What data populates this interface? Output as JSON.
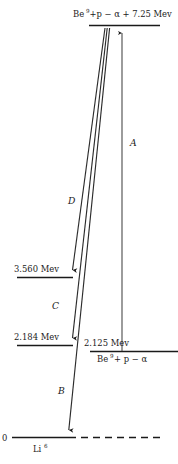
{
  "diagram": {
    "energy_unit": "Mev",
    "colors": {
      "line": "#1a1a1a",
      "transition": "#2b2b2b",
      "transition_a": "#4a4a4a",
      "background": "#ffffff"
    },
    "levels": [
      {
        "id": "top-channel",
        "label_main": "Be",
        "label_sup": "9",
        "label_rest": "+p − α + 7.25 Mev",
        "full_text": "Be⁹+p − α + 7.25 Mev",
        "energy": 7.25,
        "energy_text": "7.25 Mev"
      },
      {
        "id": "level-3560",
        "energy_text": "3.560 Mev",
        "energy": 3.56
      },
      {
        "id": "level-2184",
        "energy_text": "2.184 Mev",
        "energy": 2.184
      },
      {
        "id": "level-2125",
        "energy_text": "2.125 Mev",
        "energy": 2.125,
        "label_main": "Be",
        "label_sup": "9",
        "label_rest": "+ p − α",
        "full_text": "Be⁹ + p − α"
      },
      {
        "id": "level-ground",
        "energy_text": "0",
        "energy": 0,
        "label_main": "Li",
        "label_sup": "6",
        "full_text": "Li⁶"
      }
    ],
    "transitions": [
      {
        "id": "transition-a",
        "label": "A",
        "direction": "up"
      },
      {
        "id": "transition-b",
        "label": "B",
        "direction": "down"
      },
      {
        "id": "transition-c",
        "label": "C",
        "direction": "down"
      },
      {
        "id": "transition-d",
        "label": "D",
        "direction": "down"
      }
    ]
  }
}
